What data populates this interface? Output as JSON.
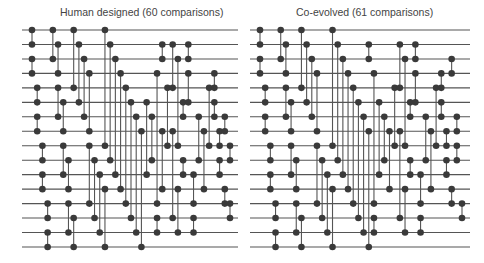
{
  "networks": [
    {
      "title": "Human designed (60 comparisons)",
      "wires": 16,
      "comparisons": 60,
      "comparators": [
        [
          0,
          1
        ],
        [
          2,
          3
        ],
        [
          4,
          5
        ],
        [
          6,
          7
        ],
        [
          8,
          9
        ],
        [
          10,
          11
        ],
        [
          12,
          13
        ],
        [
          14,
          15
        ],
        [
          0,
          2
        ],
        [
          1,
          3
        ],
        [
          4,
          6
        ],
        [
          5,
          7
        ],
        [
          8,
          10
        ],
        [
          9,
          11
        ],
        [
          12,
          14
        ],
        [
          13,
          15
        ],
        [
          0,
          4
        ],
        [
          1,
          5
        ],
        [
          2,
          6
        ],
        [
          3,
          7
        ],
        [
          8,
          12
        ],
        [
          9,
          13
        ],
        [
          10,
          14
        ],
        [
          11,
          15
        ],
        [
          0,
          8
        ],
        [
          1,
          9
        ],
        [
          2,
          10
        ],
        [
          3,
          11
        ],
        [
          4,
          12
        ],
        [
          5,
          13
        ],
        [
          6,
          14
        ],
        [
          7,
          15
        ],
        [
          5,
          10
        ],
        [
          6,
          9
        ],
        [
          3,
          12
        ],
        [
          13,
          14
        ],
        [
          7,
          11
        ],
        [
          1,
          2
        ],
        [
          4,
          8
        ],
        [
          1,
          4
        ],
        [
          7,
          13
        ],
        [
          2,
          8
        ],
        [
          11,
          14
        ],
        [
          5,
          6
        ],
        [
          9,
          10
        ],
        [
          1,
          2
        ],
        [
          3,
          5
        ],
        [
          13,
          14
        ],
        [
          10,
          12
        ],
        [
          6,
          9
        ],
        [
          7,
          11
        ],
        [
          4,
          8
        ],
        [
          3,
          4
        ],
        [
          5,
          6
        ],
        [
          7,
          8
        ],
        [
          9,
          10
        ],
        [
          11,
          12
        ],
        [
          6,
          7
        ],
        [
          8,
          9
        ],
        [
          12,
          13
        ]
      ]
    },
    {
      "title": "Co-evolved (61 comparisons)",
      "wires": 16,
      "comparisons": 61,
      "comparators": [
        [
          0,
          1
        ],
        [
          2,
          3
        ],
        [
          4,
          5
        ],
        [
          6,
          7
        ],
        [
          8,
          9
        ],
        [
          10,
          11
        ],
        [
          12,
          13
        ],
        [
          14,
          15
        ],
        [
          0,
          2
        ],
        [
          1,
          3
        ],
        [
          4,
          6
        ],
        [
          5,
          7
        ],
        [
          8,
          10
        ],
        [
          9,
          11
        ],
        [
          12,
          14
        ],
        [
          13,
          15
        ],
        [
          0,
          4
        ],
        [
          1,
          5
        ],
        [
          2,
          6
        ],
        [
          3,
          7
        ],
        [
          8,
          12
        ],
        [
          9,
          13
        ],
        [
          10,
          14
        ],
        [
          11,
          15
        ],
        [
          0,
          8
        ],
        [
          1,
          9
        ],
        [
          2,
          10
        ],
        [
          3,
          11
        ],
        [
          4,
          12
        ],
        [
          5,
          13
        ],
        [
          6,
          14
        ],
        [
          7,
          15
        ],
        [
          1,
          2
        ],
        [
          3,
          12
        ],
        [
          13,
          14
        ],
        [
          5,
          10
        ],
        [
          6,
          9
        ],
        [
          7,
          11
        ],
        [
          4,
          8
        ],
        [
          1,
          4
        ],
        [
          7,
          13
        ],
        [
          2,
          8
        ],
        [
          11,
          14
        ],
        [
          5,
          6
        ],
        [
          9,
          10
        ],
        [
          1,
          2
        ],
        [
          3,
          5
        ],
        [
          13,
          14
        ],
        [
          10,
          12
        ],
        [
          6,
          9
        ],
        [
          7,
          11
        ],
        [
          4,
          8
        ],
        [
          3,
          4
        ],
        [
          5,
          6
        ],
        [
          7,
          8
        ],
        [
          9,
          10
        ],
        [
          11,
          12
        ],
        [
          2,
          3
        ],
        [
          6,
          7
        ],
        [
          8,
          9
        ],
        [
          12,
          13
        ]
      ]
    }
  ]
}
